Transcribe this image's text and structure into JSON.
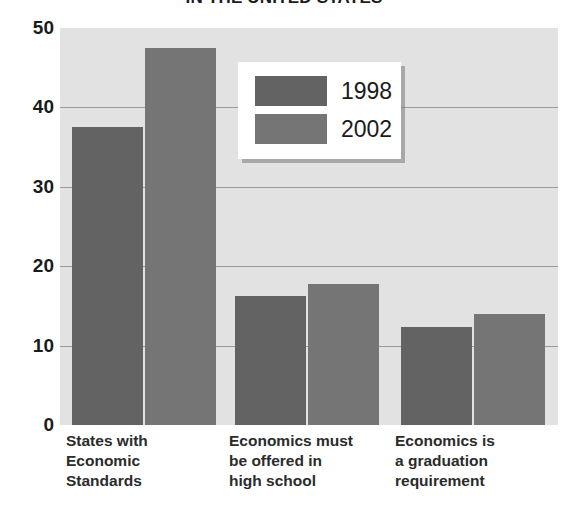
{
  "chart_data": {
    "type": "bar",
    "title": "IN THE UNITED STATES",
    "xlabel": "",
    "ylabel": "",
    "ylim": [
      0,
      50
    ],
    "yticks": [
      "0",
      "10",
      "20",
      "30",
      "40",
      "50"
    ],
    "grid": true,
    "legend_position": "upper-center",
    "categories": [
      "States with Economic Standards",
      "Economics must be offered in high school",
      "Economics is a graduation requirement"
    ],
    "category_lines": [
      [
        "States with",
        "Economic",
        "Standards"
      ],
      [
        "Economics must",
        "be offered in",
        "high school"
      ],
      [
        "Economics is",
        "a graduation",
        "requirement"
      ]
    ],
    "series": [
      {
        "name": "1998",
        "color": "#636363",
        "values": [
          37.5,
          16.2,
          12.4
        ]
      },
      {
        "name": "2002",
        "color": "#757575",
        "values": [
          47.5,
          17.8,
          14.0
        ]
      }
    ]
  },
  "legend": {
    "entries": [
      {
        "label": "1998",
        "color": "#636363"
      },
      {
        "label": "2002",
        "color": "#757575"
      }
    ]
  },
  "colors": {
    "plot_background": "#e2e2e2",
    "gridline": "#9a9a9a",
    "text": "#1b1b1b",
    "series_1998": "#636363",
    "series_2002": "#757575",
    "legend_background": "#ffffff"
  }
}
